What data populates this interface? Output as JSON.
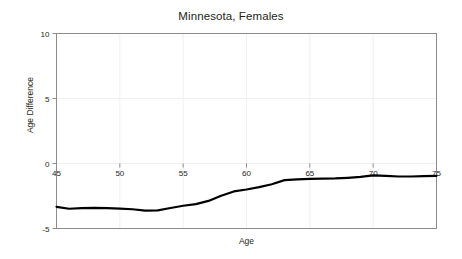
{
  "chart_data": {
    "type": "line",
    "title": "Minnesota, Females",
    "xlabel": "Age",
    "ylabel": "Age Difference",
    "xlim": [
      45,
      75
    ],
    "ylim": [
      -5,
      10
    ],
    "xticks": [
      45,
      50,
      55,
      60,
      65,
      70,
      75
    ],
    "xtick_labels": [
      "45",
      "50",
      "55",
      "60",
      "65",
      "70",
      "75"
    ],
    "yticks": [
      -5,
      0,
      5,
      10
    ],
    "ytick_labels": [
      "-5",
      "0",
      "5",
      "10"
    ],
    "grid": true,
    "grid_color": "#f0f0f0",
    "legend": null,
    "line_color": "#000000",
    "line_width": 2.2,
    "series": [
      {
        "name": "Age Difference",
        "x": [
          45,
          46,
          47,
          48,
          49,
          50,
          51,
          52,
          53,
          54,
          55,
          56,
          57,
          58,
          59,
          60,
          61,
          62,
          63,
          64,
          65,
          66,
          67,
          68,
          69,
          70,
          71,
          72,
          73,
          74,
          75
        ],
        "values": [
          -3.33,
          -3.48,
          -3.43,
          -3.42,
          -3.44,
          -3.47,
          -3.52,
          -3.62,
          -3.6,
          -3.42,
          -3.25,
          -3.12,
          -2.88,
          -2.48,
          -2.15,
          -2.0,
          -1.82,
          -1.6,
          -1.28,
          -1.22,
          -1.18,
          -1.17,
          -1.15,
          -1.1,
          -1.03,
          -0.92,
          -0.95,
          -1.0,
          -1.0,
          -0.97,
          -0.95
        ]
      }
    ]
  },
  "axes": {
    "frame_color": "#8c8c8c",
    "background": "#ffffff"
  }
}
